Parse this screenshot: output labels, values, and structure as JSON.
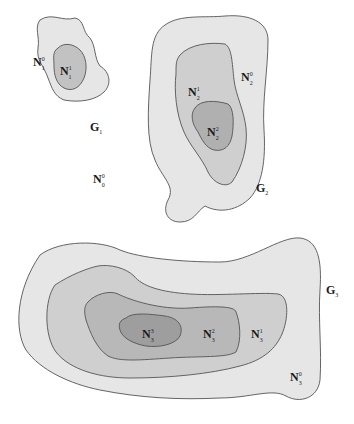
{
  "colors": {
    "level0": "#e6e6e6",
    "level1": "#cfcfcf",
    "level2": "#b8b8b8",
    "level3": "#a3a3a3",
    "outline": "#555555",
    "background": "#ffffff"
  },
  "outside": {
    "label": "N",
    "sup": "0",
    "sub": "0"
  },
  "groups": [
    {
      "name": "G",
      "index": "1",
      "regions": [
        {
          "label": "N",
          "sup": "0",
          "sub": "1"
        },
        {
          "label": "N",
          "sup": "1",
          "sub": "1"
        }
      ]
    },
    {
      "name": "G",
      "index": "2",
      "regions": [
        {
          "label": "N",
          "sup": "0",
          "sub": "2"
        },
        {
          "label": "N",
          "sup": "1",
          "sub": "2"
        },
        {
          "label": "N",
          "sup": "2",
          "sub": "2"
        }
      ]
    },
    {
      "name": "G",
      "index": "3",
      "regions": [
        {
          "label": "N",
          "sup": "0",
          "sub": "3"
        },
        {
          "label": "N",
          "sup": "1",
          "sub": "3"
        },
        {
          "label": "N",
          "sup": "2",
          "sub": "3"
        },
        {
          "label": "N",
          "sup": "3",
          "sub": "3"
        }
      ]
    }
  ]
}
